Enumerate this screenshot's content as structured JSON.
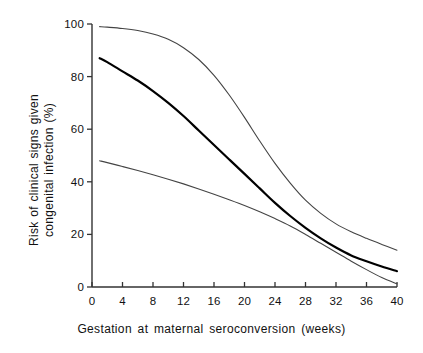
{
  "figure": {
    "background": "#ffffff",
    "axis_color": "#333333",
    "text_color": "#111111"
  },
  "axes": {
    "x_title": "Gestation at maternal seroconversion (weeks)",
    "y_title_line1": "Risk of clinical signs given",
    "y_title_line2": "congenital infection (%)",
    "x_ticks": [
      "0",
      "4",
      "8",
      "12",
      "16",
      "20",
      "24",
      "28",
      "32",
      "36",
      "40"
    ],
    "y_ticks": [
      "0",
      "20",
      "40",
      "60",
      "80",
      "100"
    ]
  },
  "chart_data": {
    "type": "line",
    "title": "",
    "xlabel": "Gestation at maternal seroconversion (weeks)",
    "ylabel": "Risk of clinical signs given congenital infection (%)",
    "xlim": [
      0,
      40
    ],
    "ylim": [
      0,
      100
    ],
    "x_ticks": [
      0,
      4,
      8,
      12,
      16,
      20,
      24,
      28,
      32,
      36,
      40
    ],
    "y_ticks": [
      0,
      20,
      40,
      60,
      80,
      100
    ],
    "grid": false,
    "legend": "none",
    "x": [
      1,
      2,
      4,
      6,
      8,
      10,
      12,
      14,
      16,
      18,
      20,
      22,
      24,
      26,
      28,
      30,
      32,
      34,
      36,
      38,
      40
    ],
    "series": [
      {
        "name": "Upper 95% confidence limit",
        "style": "thin",
        "color": "#444444",
        "values": [
          99.0,
          98.8,
          98.3,
          97.5,
          96.2,
          94.2,
          91.0,
          86.5,
          80.5,
          73.0,
          64.5,
          55.5,
          47.0,
          39.5,
          33.0,
          28.0,
          24.0,
          21.0,
          18.5,
          16.2,
          14.0
        ]
      },
      {
        "name": "Estimated risk",
        "style": "thick",
        "color": "#000000",
        "values": [
          87.0,
          85.5,
          82.0,
          78.5,
          74.5,
          70.0,
          65.0,
          59.5,
          54.0,
          48.5,
          43.0,
          37.5,
          32.0,
          27.0,
          22.5,
          18.5,
          15.0,
          12.0,
          9.8,
          7.8,
          6.0
        ]
      },
      {
        "name": "Lower 95% confidence limit",
        "style": "thin",
        "color": "#444444",
        "values": [
          48.0,
          47.3,
          45.8,
          44.3,
          42.7,
          41.0,
          39.2,
          37.3,
          35.3,
          33.2,
          31.0,
          28.6,
          26.0,
          23.2,
          20.0,
          16.6,
          13.2,
          9.8,
          6.6,
          3.6,
          1.2
        ]
      }
    ]
  }
}
